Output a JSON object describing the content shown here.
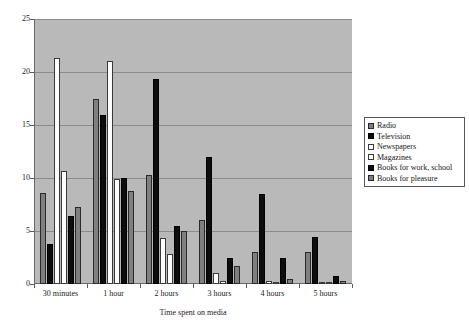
{
  "chart_data": {
    "type": "bar",
    "title": "",
    "xlabel": "Time spent on media",
    "ylabel": "",
    "ylim": [
      0,
      25
    ],
    "yticks": [
      0,
      5,
      10,
      15,
      20,
      25
    ],
    "grid": true,
    "legend_position": "right",
    "plot_background": "#b9b9b9",
    "categories": [
      "30 minutes",
      "1 hour",
      "2 hours",
      "3 hours",
      "4 hours",
      "5 hours"
    ],
    "series": [
      {
        "name": "Radio",
        "color": "#7f7f7f",
        "swatch": "sw-gray",
        "values": [
          8.6,
          17.5,
          10.3,
          6.0,
          3.0,
          3.0
        ]
      },
      {
        "name": "Television",
        "color": "#0d0d0d",
        "swatch": "sw-black",
        "values": [
          3.8,
          15.9,
          19.3,
          12.0,
          8.5,
          4.4
        ]
      },
      {
        "name": "Newspapers",
        "color": "#fdfdfd",
        "swatch": "sw-white",
        "values": [
          21.3,
          21.0,
          4.3,
          1.0,
          0.3,
          0.2
        ]
      },
      {
        "name": "Magazines",
        "color": "#fdfdfd",
        "swatch": "sw-white",
        "values": [
          10.7,
          9.9,
          2.8,
          0.3,
          0.2,
          0.1
        ]
      },
      {
        "name": "Books for work, school",
        "color": "#0d0d0d",
        "swatch": "sw-black",
        "values": [
          6.4,
          10.0,
          5.5,
          2.5,
          2.5,
          0.8
        ]
      },
      {
        "name": "Books for pleasure",
        "color": "#7f7f7f",
        "swatch": "sw-gray",
        "values": [
          7.3,
          8.8,
          5.0,
          1.7,
          0.5,
          0.3
        ]
      }
    ]
  }
}
